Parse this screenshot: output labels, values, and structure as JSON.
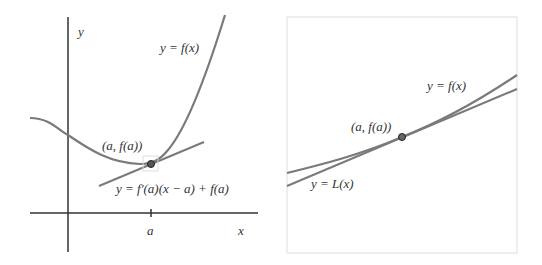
{
  "colors": {
    "curve": "#7a7a7a",
    "axis": "#333333",
    "frame": "#dddddd",
    "point_fill": "#555555"
  },
  "left_panel": {
    "axis_y_label": "y",
    "axis_x_label": "x",
    "tick_label": "a",
    "curve_label": "y = f(x)",
    "point_label": "(a, f(a))",
    "tangent_label": "y = f′(a)(x − a) + f(a)"
  },
  "right_panel": {
    "curve_label": "y = f(x)",
    "point_label": "(a, f(a))",
    "tangent_label": "y = L(x)"
  }
}
